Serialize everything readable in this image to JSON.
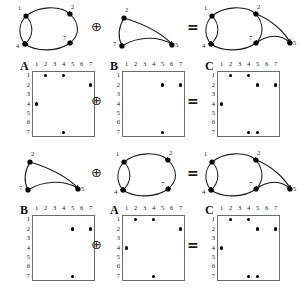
{
  "figure": {
    "operator_plus": "⊕",
    "operator_equals": "=",
    "matrix_size": 7,
    "axis_ticks": [
      "1",
      "2",
      "3",
      "4",
      "5",
      "6",
      "7"
    ]
  },
  "graphs": {
    "A": {
      "label": "A",
      "nodes": [
        {
          "id": "1",
          "x": 18,
          "y": 14
        },
        {
          "id": "2",
          "x": 62,
          "y": 12
        },
        {
          "id": "4",
          "x": 17,
          "y": 42
        },
        {
          "id": "7",
          "x": 62,
          "y": 41
        }
      ],
      "edges": [
        {
          "from": "1",
          "to": "2"
        },
        {
          "from": "1",
          "to": "4"
        },
        {
          "from": "4",
          "to": "1"
        },
        {
          "from": "7",
          "to": "4"
        },
        {
          "from": "2",
          "to": "7"
        }
      ]
    },
    "B": {
      "label": "B",
      "nodes": [
        {
          "id": "2",
          "x": 16,
          "y": 14
        },
        {
          "id": "7",
          "x": 14,
          "y": 42
        },
        {
          "id": "5",
          "x": 64,
          "y": 42
        }
      ],
      "edges": [
        {
          "from": "2",
          "to": "5"
        },
        {
          "from": "2",
          "to": "7"
        },
        {
          "from": "7",
          "to": "5"
        }
      ]
    },
    "C": {
      "label": "C",
      "nodes": [
        {
          "id": "1",
          "x": 14,
          "y": 14
        },
        {
          "id": "2",
          "x": 58,
          "y": 12
        },
        {
          "id": "4",
          "x": 13,
          "y": 42
        },
        {
          "id": "7",
          "x": 58,
          "y": 41
        },
        {
          "id": "5",
          "x": 92,
          "y": 42
        }
      ],
      "edges": [
        {
          "from": "1",
          "to": "2"
        },
        {
          "from": "1",
          "to": "4"
        },
        {
          "from": "4",
          "to": "1"
        },
        {
          "from": "7",
          "to": "4"
        },
        {
          "from": "2",
          "to": "7"
        },
        {
          "from": "2",
          "to": "5"
        },
        {
          "from": "7",
          "to": "5"
        }
      ]
    }
  },
  "matrices": {
    "A": {
      "label": "A",
      "cells": [
        {
          "row": 1,
          "col": 2
        },
        {
          "row": 1,
          "col": 4
        },
        {
          "row": 2,
          "col": 7
        },
        {
          "row": 4,
          "col": 1
        },
        {
          "row": 7,
          "col": 4
        }
      ]
    },
    "B": {
      "label": "B",
      "cells": [
        {
          "row": 2,
          "col": 5
        },
        {
          "row": 2,
          "col": 7
        },
        {
          "row": 7,
          "col": 5
        }
      ]
    },
    "C": {
      "label": "C",
      "cells": [
        {
          "row": 1,
          "col": 2
        },
        {
          "row": 1,
          "col": 4
        },
        {
          "row": 2,
          "col": 5
        },
        {
          "row": 2,
          "col": 7
        },
        {
          "row": 4,
          "col": 1
        },
        {
          "row": 7,
          "col": 4
        },
        {
          "row": 7,
          "col": 5
        }
      ]
    }
  },
  "rows": [
    {
      "name": "row-1-graphs",
      "left_graph": "A",
      "right_graph": "B",
      "result_graph": "C"
    },
    {
      "name": "row-2-matrices",
      "left_matrix": "A",
      "right_matrix": "B",
      "result_matrix": "C"
    },
    {
      "name": "row-3-graphs",
      "left_graph": "B",
      "right_graph": "A",
      "result_graph": "C"
    },
    {
      "name": "row-4-matrices",
      "left_matrix": "B",
      "right_matrix": "A",
      "result_matrix": "C"
    }
  ],
  "colors": {
    "stroke": "#1a1a1a",
    "node": "#000000",
    "matrix_border": "#6b6b6b",
    "background": "#ffffff"
  }
}
